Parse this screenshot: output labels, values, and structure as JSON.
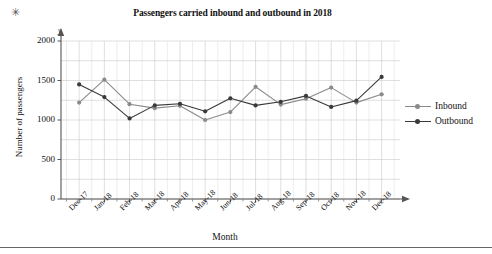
{
  "page": {
    "marker_symbol": "✳",
    "bottom_rule": true
  },
  "axis_letters": {
    "y": "y"
  },
  "legend": {
    "position": "right",
    "entries": [
      {
        "label": "Inbound",
        "color": "#8a8a8a"
      },
      {
        "label": "Outbound",
        "color": "#3a3a3a"
      }
    ]
  },
  "chart_data": {
    "type": "line",
    "title": "Passengers carried inbound and outbound in 2018",
    "xlabel": "Month",
    "ylabel": "Number of passengers",
    "categories": [
      "Dec-17",
      "Jan-18",
      "Feb-18",
      "Mar-18",
      "Apr-18",
      "May-18",
      "Jun-18",
      "Jul-18",
      "Aug-18",
      "Sep-18",
      "Oct-18",
      "Nov-18",
      "Dec-18"
    ],
    "ylim": [
      0,
      2000
    ],
    "yticks": [
      0,
      500,
      1000,
      1500,
      2000
    ],
    "ytick_labels": [
      "0",
      "500",
      "1000",
      "1500",
      "2000"
    ],
    "grid": true,
    "grid_minor_step": 250,
    "legend_position": "right",
    "series": [
      {
        "name": "Inbound",
        "color": "#8a8a8a",
        "values": [
          1220,
          1510,
          1200,
          1150,
          1180,
          1000,
          1100,
          1420,
          1195,
          1270,
          1410,
          1220,
          1325
        ]
      },
      {
        "name": "Outbound",
        "color": "#3a3a3a",
        "values": [
          1450,
          1290,
          1020,
          1185,
          1205,
          1110,
          1275,
          1185,
          1230,
          1305,
          1165,
          1245,
          1545
        ]
      }
    ]
  }
}
